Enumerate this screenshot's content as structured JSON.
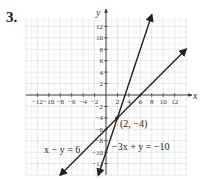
{
  "problem": {
    "number": "3."
  },
  "chart_data": {
    "type": "line",
    "title": "",
    "xlabel": "x",
    "ylabel": "y",
    "xlim": [
      -14,
      14
    ],
    "ylim": [
      -14,
      14
    ],
    "grid": true,
    "x_ticks": [
      -12,
      -10,
      -8,
      -6,
      -4,
      -2,
      2,
      4,
      6,
      8,
      10,
      12
    ],
    "y_ticks": [
      12,
      10,
      8,
      6,
      4,
      2,
      -2,
      -4,
      -6,
      -8,
      -10,
      -12
    ],
    "x_tick_labels": [
      "−12",
      "−10",
      "−8",
      "−6",
      "−4",
      "−2",
      "2",
      "4",
      "6",
      "8",
      "10",
      "12"
    ],
    "y_tick_labels": [
      "12",
      "10",
      "8",
      "6",
      "4",
      "2",
      "−2",
      "−4",
      "−6",
      "−8",
      "−10",
      "−12"
    ],
    "series": [
      {
        "name": "x − y = 6",
        "equation": "y = x - 6",
        "x": [
          -8,
          14
        ],
        "y": [
          -14,
          8
        ],
        "color": "#222222"
      },
      {
        "name": "−3x + y = −10",
        "equation": "y = 3x - 10",
        "x": [
          -1.33,
          8
        ],
        "y": [
          -14,
          14
        ],
        "color": "#222222"
      }
    ],
    "annotations": [
      {
        "text": "(2, −4)",
        "x": 2,
        "y": -4,
        "type": "intersection-point"
      }
    ]
  },
  "labels": {
    "x_axis": "x",
    "y_axis": "y",
    "line1": "x − y = 6",
    "line2": "−3x + y = −10",
    "intersection": "(2, −4)"
  }
}
